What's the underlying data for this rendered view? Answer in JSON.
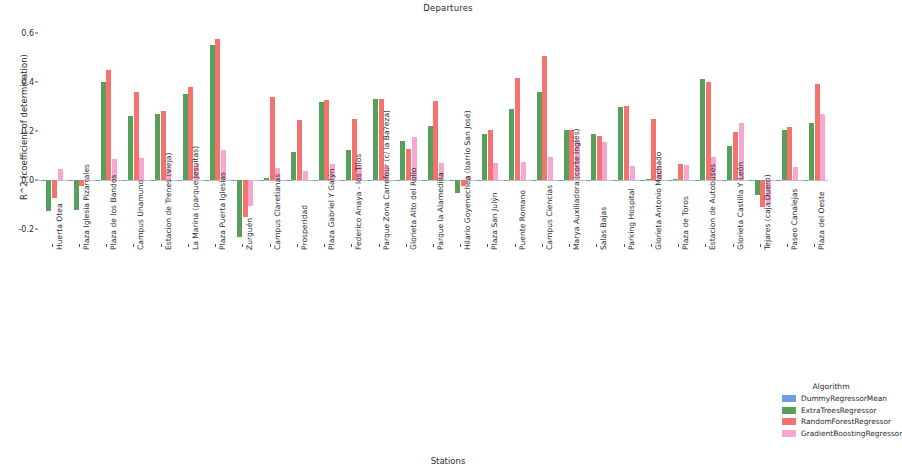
{
  "chart_data": {
    "type": "bar",
    "title": "Departures",
    "xlabel": "Stations",
    "ylabel": "R^2 (coefficient of determination)",
    "legend_title": "Algorithm",
    "legend_position": "bottom-right",
    "grid": false,
    "ylim": [
      -0.26,
      0.63
    ],
    "yticks": [
      0.6,
      0.4,
      0.2,
      0.0,
      -0.2
    ],
    "ytick_labels": [
      "0.6",
      "0.4",
      "0.2",
      "0.0",
      "-0.2"
    ],
    "colors": {
      "DummyRegressorMean": "#6a9fe0",
      "ExtraTreesRegressor": "#57a05c",
      "RandomForestRegressor": "#f4736f",
      "GradientBoostingRegressor": "#f7a8d0"
    },
    "categories": [
      "Huerta Otea",
      "Plaza Iglesia Pizarrales",
      "Plaza de los Bandos",
      "Campus Unamuno",
      "Estacion de Trenes (vieja)",
      "La Marina (parque Jesuitas)",
      "Plaza Puerta Iglesias",
      "Zurguén",
      "Campus Claretianas",
      "Prosperidad",
      "Plaza Gabriel Y Galýn",
      "Federico Anaya - los Tilos",
      "Parque Zona Carrefour (c/ la Ba?eza)",
      "Glorieta Alto del Rollo",
      "Parque la Alamedilla",
      "Hilario Goyenechea (barrio San José)",
      "Plaza San Julýn",
      "Puente Romano",
      "Campus Ciencias",
      "Marya Auxiliadora (corte Inglés)",
      "Salas Bajas",
      "Parking Hospital",
      "Glorieta Antonio Machado",
      "Plaza de Toros",
      "Estacion de Autobuses",
      "Glorieta Castilla Y León",
      "Tejares (caja Duero)",
      "Paseo Canalejas",
      "Plaza del Oeste"
    ],
    "series": [
      {
        "name": "DummyRegressorMean",
        "values": [
          -0.004,
          -0.003,
          -0.004,
          -0.003,
          -0.003,
          -0.004,
          -0.003,
          -0.004,
          -0.004,
          -0.003,
          -0.004,
          -0.003,
          -0.004,
          -0.003,
          -0.004,
          -0.003,
          -0.004,
          -0.003,
          -0.004,
          -0.003,
          -0.004,
          -0.003,
          -0.004,
          -0.003,
          -0.004,
          -0.003,
          -0.004,
          -0.003,
          -0.004
        ]
      },
      {
        "name": "ExtraTreesRegressor",
        "values": [
          -0.125,
          -0.122,
          0.4,
          0.262,
          0.272,
          0.352,
          0.552,
          -0.232,
          0.008,
          0.115,
          0.318,
          0.125,
          0.332,
          0.16,
          0.222,
          -0.052,
          0.19,
          0.292,
          0.362,
          0.205,
          0.19,
          0.298,
          0.004,
          0.004,
          0.412,
          0.142,
          -0.06,
          0.205,
          0.232
        ]
      },
      {
        "name": "RandomForestRegressor",
        "values": [
          -0.072,
          -0.022,
          0.452,
          0.362,
          0.285,
          0.38,
          0.578,
          -0.148,
          0.34,
          0.248,
          0.328,
          0.25,
          0.332,
          0.128,
          0.325,
          -0.022,
          0.205,
          0.418,
          0.508,
          0.205,
          0.18,
          0.305,
          0.252,
          0.068,
          0.402,
          0.198,
          -0.11,
          0.218,
          0.392
        ]
      },
      {
        "name": "GradientBoostingRegressor",
        "values": [
          0.048,
          0.005,
          0.085,
          0.092,
          0.045,
          0.068,
          0.125,
          -0.105,
          0.05,
          0.04,
          0.068,
          0.06,
          0.06,
          0.178,
          0.07,
          0.018,
          0.072,
          0.075,
          0.095,
          0.165,
          0.155,
          0.058,
          0.06,
          0.062,
          0.095,
          0.232,
          -0.095,
          0.055,
          0.272
        ]
      }
    ]
  }
}
